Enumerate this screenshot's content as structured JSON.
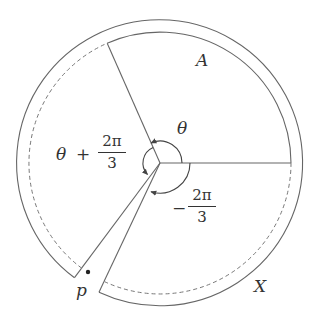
{
  "diagram": {
    "labels": {
      "region_A": "A",
      "region_X": "X",
      "point_p": "p",
      "angle_theta": "θ",
      "angle_theta_plus": {
        "prefix_var": "θ",
        "operator": "+",
        "numerator": "2π",
        "denominator": "3"
      },
      "angle_minus": {
        "operator": "−",
        "numerator": "2π",
        "denominator": "3"
      }
    },
    "colors": {
      "stroke": "#555555",
      "text": "#333333",
      "background": "#ffffff"
    }
  }
}
